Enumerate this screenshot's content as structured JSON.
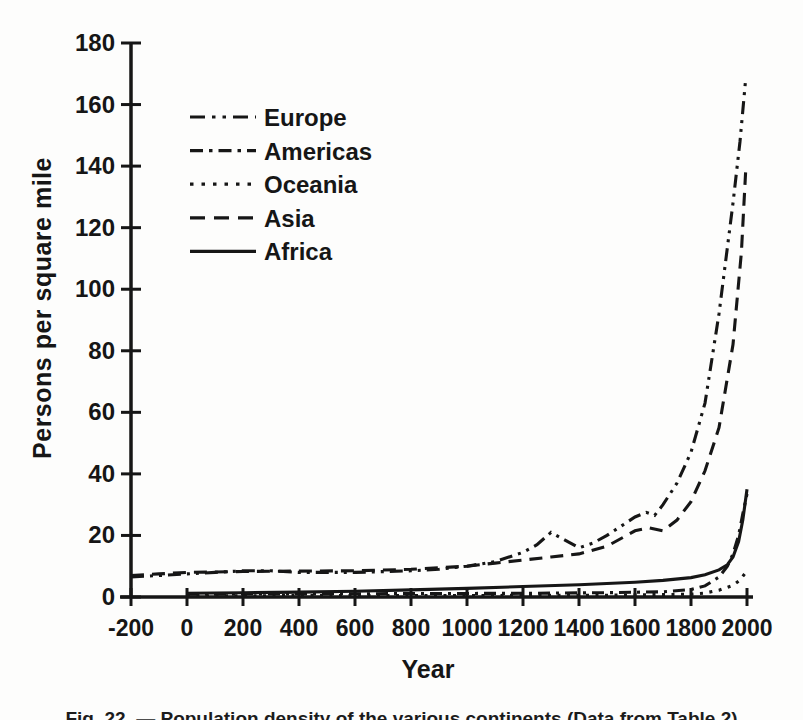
{
  "figure": {
    "caption": "Fig. 22. — Population density of the various continents (Data from Table 2)"
  },
  "chart_data": {
    "type": "line",
    "title": "",
    "xlabel": "Year",
    "ylabel": "Persons per square mile",
    "xlim": [
      -200,
      2000
    ],
    "ylim": [
      0,
      180
    ],
    "x_ticks": [
      -200,
      0,
      200,
      400,
      600,
      800,
      1000,
      1200,
      1400,
      1600,
      1800,
      2000
    ],
    "y_ticks": [
      0,
      20,
      40,
      60,
      80,
      100,
      120,
      140,
      160,
      180
    ],
    "grid": false,
    "legend_position": "upper-left-inside",
    "line_color": "#161616",
    "series": [
      {
        "name": "Europe",
        "style": "dash-dot-dot",
        "points": [
          [
            -200,
            6.5
          ],
          [
            -100,
            7
          ],
          [
            0,
            7.5
          ],
          [
            100,
            8
          ],
          [
            200,
            8.5
          ],
          [
            300,
            8.5
          ],
          [
            400,
            8
          ],
          [
            600,
            8
          ],
          [
            800,
            8.5
          ],
          [
            900,
            9
          ],
          [
            1000,
            10
          ],
          [
            1100,
            11.5
          ],
          [
            1200,
            14.5
          ],
          [
            1250,
            17
          ],
          [
            1300,
            21
          ],
          [
            1350,
            18.5
          ],
          [
            1400,
            16
          ],
          [
            1450,
            17.5
          ],
          [
            1500,
            20
          ],
          [
            1550,
            23
          ],
          [
            1600,
            26
          ],
          [
            1640,
            27.5
          ],
          [
            1670,
            26.5
          ],
          [
            1700,
            30
          ],
          [
            1750,
            37
          ],
          [
            1800,
            47
          ],
          [
            1850,
            63
          ],
          [
            1900,
            92
          ],
          [
            1950,
            128
          ],
          [
            1975,
            148
          ],
          [
            1995,
            168
          ]
        ]
      },
      {
        "name": "Americas",
        "style": "dash-dot",
        "points": [
          [
            0,
            0.9
          ],
          [
            400,
            1
          ],
          [
            800,
            1.1
          ],
          [
            1200,
            1.2
          ],
          [
            1500,
            1.4
          ],
          [
            1700,
            1.7
          ],
          [
            1800,
            2.4
          ],
          [
            1850,
            3.6
          ],
          [
            1900,
            6.5
          ],
          [
            1930,
            10
          ],
          [
            1950,
            14
          ],
          [
            1970,
            20
          ],
          [
            1985,
            27
          ],
          [
            2000,
            33.5
          ]
        ]
      },
      {
        "name": "Oceania",
        "style": "dotted",
        "points": [
          [
            0,
            0.4
          ],
          [
            500,
            0.45
          ],
          [
            1000,
            0.5
          ],
          [
            1500,
            0.6
          ],
          [
            1800,
            0.9
          ],
          [
            1850,
            1.3
          ],
          [
            1900,
            2.2
          ],
          [
            1950,
            3.8
          ],
          [
            1975,
            5.5
          ],
          [
            2000,
            8.5
          ]
        ]
      },
      {
        "name": "Asia",
        "style": "dashed",
        "points": [
          [
            -200,
            7
          ],
          [
            -100,
            7.5
          ],
          [
            0,
            8
          ],
          [
            200,
            8.3
          ],
          [
            400,
            8.4
          ],
          [
            600,
            8.5
          ],
          [
            800,
            9
          ],
          [
            1000,
            10
          ],
          [
            1100,
            11
          ],
          [
            1200,
            12
          ],
          [
            1300,
            13
          ],
          [
            1400,
            14
          ],
          [
            1500,
            16.5
          ],
          [
            1600,
            21.5
          ],
          [
            1650,
            22.5
          ],
          [
            1700,
            21.5
          ],
          [
            1750,
            25
          ],
          [
            1800,
            31
          ],
          [
            1850,
            41
          ],
          [
            1900,
            55
          ],
          [
            1950,
            82
          ],
          [
            1980,
            112
          ],
          [
            1995,
            138
          ]
        ]
      },
      {
        "name": "Africa",
        "style": "solid",
        "points": [
          [
            0,
            1.2
          ],
          [
            200,
            1.4
          ],
          [
            400,
            1.6
          ],
          [
            600,
            1.9
          ],
          [
            800,
            2.3
          ],
          [
            1000,
            2.8
          ],
          [
            1200,
            3.4
          ],
          [
            1400,
            4
          ],
          [
            1600,
            4.8
          ],
          [
            1700,
            5.4
          ],
          [
            1800,
            6.3
          ],
          [
            1850,
            7.2
          ],
          [
            1900,
            8.8
          ],
          [
            1930,
            10.5
          ],
          [
            1950,
            13
          ],
          [
            1970,
            18
          ],
          [
            1985,
            25
          ],
          [
            2000,
            35
          ]
        ]
      }
    ]
  }
}
